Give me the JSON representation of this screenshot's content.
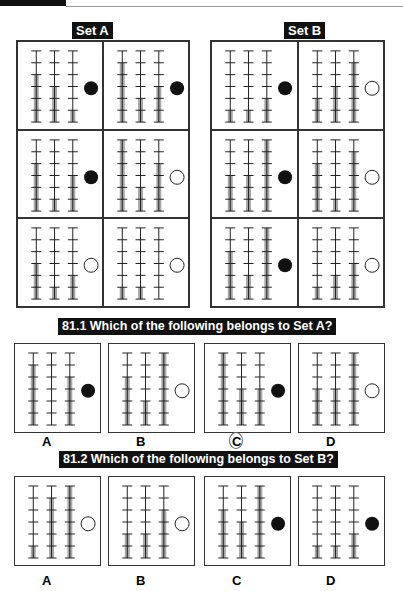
{
  "headings": {
    "set_a": "Set A",
    "set_b": "Set B",
    "q1": "81.1 Which of the following belongs to Set A?",
    "q2": "81.2 Which of the following belongs to Set B?"
  },
  "legend": {
    "ticks_per_rod": 6,
    "rods_per_panel": 3
  },
  "set_a": [
    {
      "rods": [
        4,
        3,
        1
      ],
      "dot": "filled"
    },
    {
      "rods": [
        5,
        2,
        3
      ],
      "dot": "filled"
    },
    {
      "rods": [
        4,
        1,
        3
      ],
      "dot": "filled"
    },
    {
      "rods": [
        6,
        2,
        4
      ],
      "dot": "empty"
    },
    {
      "rods": [
        3,
        1,
        2
      ],
      "dot": "empty"
    },
    {
      "rods": [
        1,
        1,
        0
      ],
      "dot": "empty"
    }
  ],
  "set_b": [
    {
      "rods": [
        1,
        1,
        2
      ],
      "dot": "filled"
    },
    {
      "rods": [
        2,
        3,
        5
      ],
      "dot": "empty"
    },
    {
      "rods": [
        3,
        3,
        6
      ],
      "dot": "filled"
    },
    {
      "rods": [
        4,
        1,
        5
      ],
      "dot": "empty"
    },
    {
      "rods": [
        4,
        2,
        6
      ],
      "dot": "filled"
    },
    {
      "rods": [
        1,
        2,
        3
      ],
      "dot": "empty"
    }
  ],
  "q1_options": [
    {
      "letter": "A",
      "rods": [
        5,
        0,
        4
      ],
      "dot": "filled"
    },
    {
      "letter": "B",
      "rods": [
        4,
        2,
        6
      ],
      "dot": "empty"
    },
    {
      "letter": "C",
      "rods": [
        6,
        3,
        3
      ],
      "dot": "filled",
      "circled": true
    },
    {
      "letter": "D",
      "rods": [
        3,
        3,
        6
      ],
      "dot": "empty"
    }
  ],
  "q2_options": [
    {
      "letter": "A",
      "rods": [
        1,
        5,
        6
      ],
      "dot": "empty"
    },
    {
      "letter": "B",
      "rods": [
        2,
        2,
        4
      ],
      "dot": "empty"
    },
    {
      "letter": "C",
      "rods": [
        4,
        3,
        6
      ],
      "dot": "filled"
    },
    {
      "letter": "D",
      "rods": [
        1,
        1,
        2
      ],
      "dot": "filled"
    }
  ],
  "colors": {
    "bar": "#a8a8a8",
    "line": "#222222",
    "label_bg": "#111111"
  }
}
